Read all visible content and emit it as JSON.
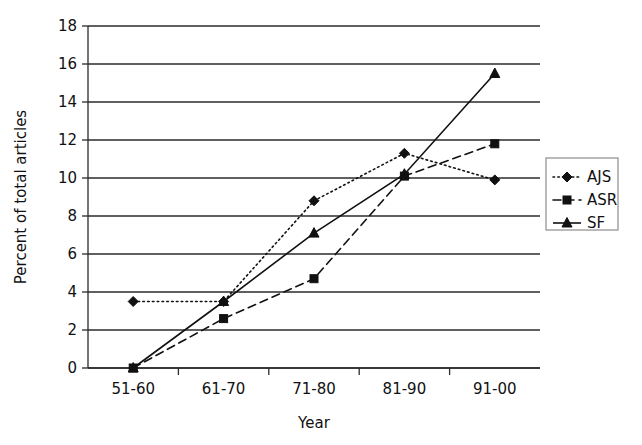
{
  "chart_data": {
    "type": "line",
    "title": "",
    "xlabel": "Year",
    "ylabel": "Percent of total articles",
    "categories": [
      "51-60",
      "61-70",
      "71-80",
      "81-90",
      "91-00"
    ],
    "ylim": [
      0,
      18
    ],
    "ytick_step": 2,
    "yticks": [
      "0",
      "2",
      "4",
      "6",
      "8",
      "10",
      "12",
      "14",
      "16",
      "18"
    ],
    "grid": "horizontal",
    "legend_position": "right",
    "series": [
      {
        "name": "AJS",
        "values": [
          3.5,
          3.5,
          8.8,
          11.3,
          9.9
        ],
        "line_style": "dotted",
        "marker": "diamond",
        "color": "#111111"
      },
      {
        "name": "ASR",
        "values": [
          0.0,
          2.6,
          4.7,
          10.1,
          11.8
        ],
        "line_style": "dashed",
        "marker": "square",
        "color": "#111111"
      },
      {
        "name": "SF",
        "values": [
          0.0,
          3.5,
          7.1,
          10.2,
          15.5
        ],
        "line_style": "solid",
        "marker": "triangle",
        "color": "#111111"
      }
    ]
  },
  "legend": {
    "entries": [
      {
        "label": "AJS"
      },
      {
        "label": "ASR"
      },
      {
        "label": "SF"
      }
    ]
  }
}
